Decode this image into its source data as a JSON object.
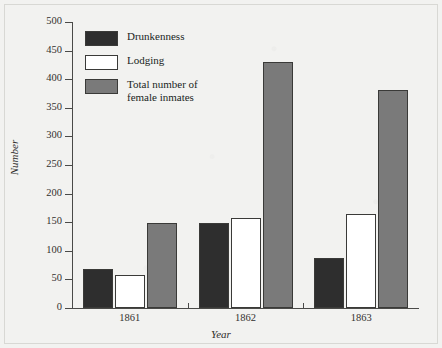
{
  "chart_data": {
    "type": "bar",
    "title": "",
    "xlabel": "Year",
    "ylabel": "Number",
    "categories": [
      "1861",
      "1862",
      "1863"
    ],
    "series": [
      {
        "name": "Drunkenness",
        "color": "#2e2e2e",
        "values": [
          68,
          148,
          88
        ]
      },
      {
        "name": "Lodging",
        "color": "#ffffff",
        "values": [
          58,
          157,
          165
        ]
      },
      {
        "name": "Total number of\nfemale inmates",
        "color": "#7a7a7a",
        "values": [
          148,
          430,
          381
        ]
      }
    ],
    "ylim": [
      0,
      500
    ],
    "yticks": [
      0,
      50,
      100,
      150,
      200,
      250,
      300,
      350,
      400,
      450,
      500
    ],
    "ytick_labels": [
      "0",
      "50",
      "100",
      "150",
      "200",
      "250",
      "300",
      "350",
      "400",
      "450",
      "500"
    ],
    "grid": false,
    "legend_position": "top-left"
  },
  "legend": {
    "items": [
      {
        "label": "Drunkenness",
        "color": "#2e2e2e"
      },
      {
        "label": "Lodging",
        "color": "#ffffff"
      },
      {
        "label": "Total number of\nfemale inmates",
        "color": "#7a7a7a"
      }
    ]
  },
  "axes": {
    "y_title": "Number",
    "x_title": "Year"
  },
  "colors": {
    "background": "#f2f2f0",
    "axis": "#4a4a48",
    "text": "#33312f",
    "bar_dark": "#2e2e2e",
    "bar_white": "#ffffff",
    "bar_gray": "#7a7a7a",
    "bar_outline": "#3a3a38"
  }
}
